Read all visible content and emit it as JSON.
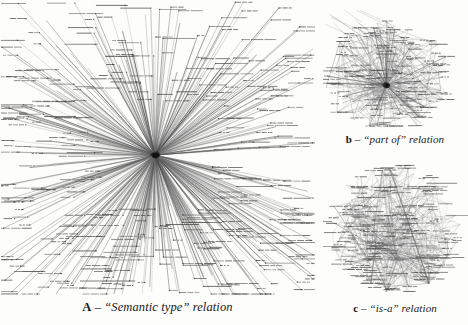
{
  "figure": {
    "background_color": "#fdfdfc",
    "ink_color": "#555555",
    "width": 468,
    "height": 325
  },
  "panels": [
    {
      "id": "a",
      "letter": "A",
      "dash": " – ",
      "caption_rest": "“Semantic type” relation",
      "full_caption": "A – “Semantic type” relation",
      "layout": "single-hub radial star",
      "hub": {
        "x": 0.492,
        "y": 0.524
      },
      "node_count": 420,
      "edge_count": 420,
      "seed": 17
    },
    {
      "id": "b",
      "letter": "b",
      "dash": " – ",
      "caption_rest": "“part of” relation",
      "full_caption": "b – “part of” relation",
      "layout": "dense hub with mesh",
      "hub": {
        "x": 0.44,
        "y": 0.65
      },
      "node_count": 210,
      "edge_count": 300,
      "seed": 43
    },
    {
      "id": "c",
      "letter": "c",
      "dash": " – ",
      "caption_rest": "“is-a” relation",
      "full_caption": "c – “is-a” relation",
      "layout": "distributed mesh, no dominant hub",
      "hub": {
        "x": 0.48,
        "y": 0.46
      },
      "node_count": 230,
      "edge_count": 280,
      "seed": 91
    }
  ],
  "chart_data": {
    "type": "diagram",
    "title": "",
    "graphs": [
      {
        "name": "A – “Semantic type” relation",
        "topology": "star / single central hub",
        "nodes": 420,
        "edges": 420,
        "hub_degree": 420,
        "label_style": "horizontal micro-text at each leaf"
      },
      {
        "name": "b – “part of” relation",
        "topology": "hub-and-mesh",
        "nodes": 210,
        "edges": 300,
        "hub_degree": 90,
        "label_style": "horizontal micro-text at each node"
      },
      {
        "name": "c – “is-a” relation",
        "topology": "distributed mesh",
        "nodes": 230,
        "edges": 280,
        "hub_degree": 22,
        "label_style": "horizontal micro-text at each node"
      }
    ]
  }
}
